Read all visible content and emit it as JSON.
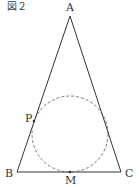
{
  "figure": {
    "caption": "図２",
    "labels": {
      "A": "A",
      "B": "B",
      "C": "C",
      "P": "P",
      "M": "M"
    },
    "stroke_color": "#333333"
  }
}
